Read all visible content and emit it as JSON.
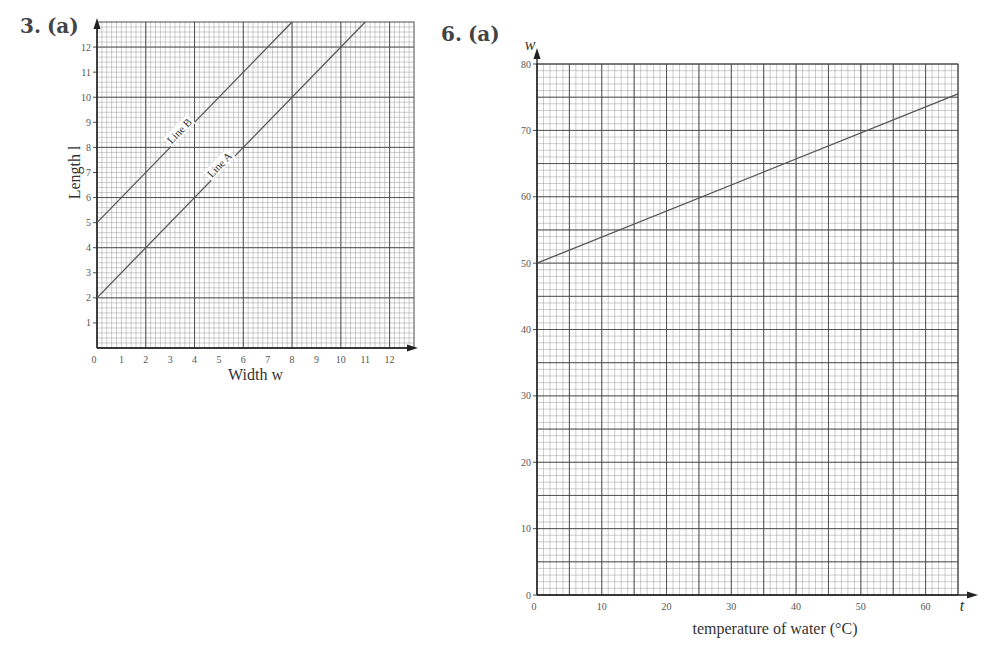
{
  "questions": [
    {
      "number": "3.",
      "part": "(a)"
    },
    {
      "number": "6.",
      "part": "(a)"
    }
  ],
  "colors": {
    "grid_minor": "#9a9a9a",
    "grid_major": "#444444",
    "line": "#555555",
    "axis": "#222222"
  },
  "chart_data": [
    {
      "type": "line",
      "title": "3. (a)",
      "xlabel": "Width w",
      "ylabel": "Length l",
      "xlim": [
        0,
        13
      ],
      "ylim": [
        0,
        13
      ],
      "x_ticks": [
        "0",
        "1",
        "2",
        "3",
        "4",
        "5",
        "6",
        "7",
        "8",
        "9",
        "10",
        "11",
        "12"
      ],
      "y_ticks": [
        "1",
        "2",
        "3",
        "4",
        "5",
        "6",
        "7",
        "8",
        "9",
        "10",
        "11",
        "12"
      ],
      "grid": true,
      "series": [
        {
          "name": "Line B",
          "x": [
            0,
            8
          ],
          "y": [
            5,
            13
          ]
        },
        {
          "name": "Line A",
          "x": [
            0,
            11
          ],
          "y": [
            2,
            13
          ]
        }
      ]
    },
    {
      "type": "line",
      "title": "6. (a)",
      "xlabel": "temperature of water (°C)",
      "x_axis_symbol": "t",
      "ylabel": "w",
      "xlim": [
        0,
        65
      ],
      "ylim": [
        0,
        80
      ],
      "x_ticks": [
        "0",
        "10",
        "20",
        "30",
        "40",
        "50",
        "60"
      ],
      "y_ticks": [
        "0",
        "10",
        "20",
        "30",
        "40",
        "50",
        "60",
        "70",
        "80"
      ],
      "grid": true,
      "series": [
        {
          "name": "line",
          "x": [
            0,
            65
          ],
          "y": [
            50,
            75.5
          ]
        }
      ]
    }
  ]
}
